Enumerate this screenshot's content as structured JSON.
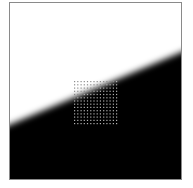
{
  "figure": {
    "colors": {
      "light": "#ffffff",
      "dark": "#000000",
      "border": "#8a8a8a",
      "grid_dot": "#9a9a9a"
    },
    "edge": {
      "left_y": 126,
      "right_y": 45,
      "blur_px": 4
    },
    "grid": {
      "x": 64,
      "y": 78,
      "width": 42,
      "height": 42,
      "cols": 14,
      "rows": 14
    }
  }
}
